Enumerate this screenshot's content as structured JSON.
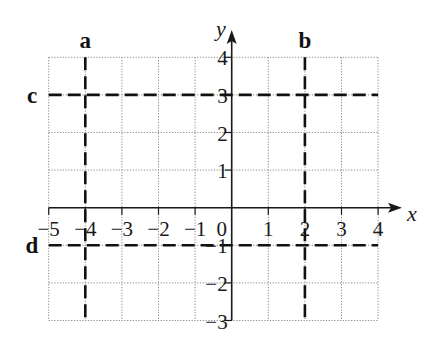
{
  "chart_data": {
    "type": "coordinate-grid",
    "title": "",
    "xlabel": "x",
    "ylabel": "y",
    "xlim": [
      -5,
      4
    ],
    "ylim": [
      -3,
      4
    ],
    "grid": true,
    "x_ticks": [
      "−5",
      "−4",
      "−3",
      "−2",
      "−1",
      "0",
      "1",
      "2",
      "3",
      "4"
    ],
    "y_ticks": [
      "4",
      "3",
      "2",
      "1",
      "−1",
      "−2",
      "−3"
    ],
    "lines": [
      {
        "label": "a",
        "orientation": "vertical",
        "equation": "x = -4",
        "value": -4,
        "style": "dashed"
      },
      {
        "label": "b",
        "orientation": "vertical",
        "equation": "x = 2",
        "value": 2,
        "style": "dashed"
      },
      {
        "label": "c",
        "orientation": "horizontal",
        "equation": "y = 3",
        "value": 3,
        "style": "dashed"
      },
      {
        "label": "d",
        "orientation": "horizontal",
        "equation": "y = -1",
        "value": -1,
        "style": "dashed"
      }
    ]
  },
  "axes": {
    "x_name": "x",
    "y_name": "y",
    "origin_label": "0"
  },
  "colors": {
    "grid": "#8a8a8a",
    "axis": "#1a1a1a",
    "dashed_line": "#111111",
    "background": "#ffffff"
  }
}
